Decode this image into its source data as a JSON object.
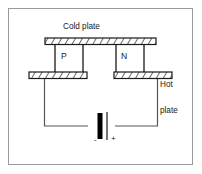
{
  "figure": {
    "border_color": "#9a9a9a",
    "background_color": "#ffffff",
    "line_color": "#1a1a1a"
  },
  "labels": {
    "cold_plate": "Cold plate",
    "hot_plate_line1": "Hot",
    "hot_plate_line2": "plate",
    "p_element": "P",
    "n_element": "N",
    "battery_negative": "-",
    "battery_positive": "+"
  },
  "components": {
    "cold_plate": {
      "name": "cold-plate",
      "hatched": true,
      "fill": "#ffffff",
      "stroke": "#1a1a1a"
    },
    "hot_plate_left": {
      "name": "hot-plate-left",
      "hatched": true,
      "fill": "#ffffff",
      "stroke": "#1a1a1a"
    },
    "hot_plate_right": {
      "name": "hot-plate-right",
      "hatched": true,
      "fill": "#ffffff",
      "stroke": "#1a1a1a"
    },
    "p_block": {
      "name": "p-semiconductor-block",
      "fill": "#ffffff",
      "stroke": "#1a1a1a"
    },
    "n_block": {
      "name": "n-semiconductor-block",
      "fill": "#ffffff",
      "stroke": "#1a1a1a"
    },
    "battery": {
      "name": "battery-symbol",
      "negative_terminal_fill": "#000000",
      "positive_terminal_stroke": "#1a1a1a"
    },
    "wires": {
      "name": "circuit-wires",
      "stroke": "#555555"
    }
  }
}
